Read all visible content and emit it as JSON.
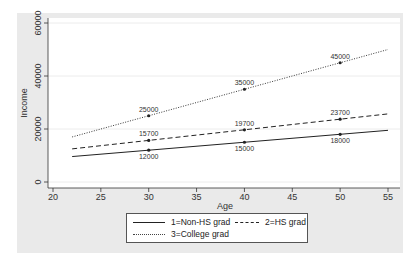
{
  "chart_data": {
    "type": "line",
    "title": "",
    "xlabel": "Age",
    "ylabel": "Income",
    "xlim": [
      20,
      55
    ],
    "ylim": [
      0,
      60000
    ],
    "x_ticks": [
      "20",
      "25",
      "30",
      "35",
      "40",
      "45",
      "50",
      "55"
    ],
    "y_ticks": [
      "0",
      "20000",
      "40000",
      "60000"
    ],
    "grid": true,
    "legend_position": "bottom",
    "x_range_lines": [
      22,
      55
    ],
    "series": [
      {
        "name": "1=Non-HS grad",
        "style": "solid",
        "x": [
          30,
          40,
          50
        ],
        "values": [
          12000,
          15000,
          18000
        ],
        "labels": [
          "12000",
          "15000",
          "18000"
        ],
        "label_position": "below"
      },
      {
        "name": "2=HS grad",
        "style": "dashed",
        "x": [
          30,
          40,
          50
        ],
        "values": [
          15700,
          19700,
          23700
        ],
        "labels": [
          "15700",
          "19700",
          "23700"
        ],
        "label_position": "above"
      },
      {
        "name": "3=College grad",
        "style": "dotted",
        "x": [
          30,
          40,
          50
        ],
        "values": [
          25000,
          35000,
          45000
        ],
        "labels": [
          "25000",
          "35000",
          "45000"
        ],
        "label_position": "above"
      }
    ]
  },
  "legend": {
    "items": [
      "1=Non-HS grad",
      "2=HS grad",
      "3=College grad"
    ]
  },
  "axes": {
    "x_title": "Age",
    "y_title": "Income"
  }
}
